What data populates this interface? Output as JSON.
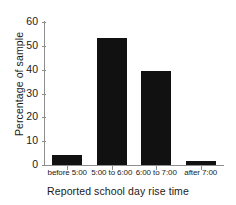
{
  "chart_data": {
    "type": "bar",
    "title": "",
    "subtitle": "",
    "xlabel": "Reported school day rise time",
    "ylabel": "Percentage of sample",
    "categories": [
      "before 5:00",
      "5:00 to 6:00",
      "6:00 to 7:00",
      "after 7:00"
    ],
    "values": [
      4,
      53.5,
      39.5,
      1.8
    ],
    "ylim": [
      0,
      60
    ],
    "yticks": [
      0,
      10,
      20,
      30,
      40,
      50,
      60
    ],
    "ytick_labels": [
      "0",
      "10",
      "20",
      "30",
      "40",
      "50",
      "60"
    ],
    "grid": false,
    "legend": false,
    "bar_color": "#111111",
    "axis_color": "#8e8e8e",
    "background": "#ffffff"
  }
}
